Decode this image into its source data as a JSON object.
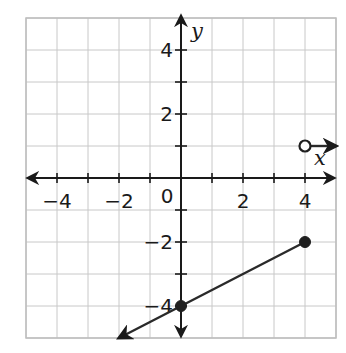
{
  "chart_data": {
    "type": "line",
    "title": "",
    "xlabel": "x",
    "ylabel": "y",
    "xlim": [
      -5,
      5
    ],
    "ylim": [
      -5,
      5
    ],
    "grid": true,
    "grid_step": 1,
    "x_ticks": [
      -4,
      -2,
      0,
      2,
      4
    ],
    "x_tick_labels": [
      "−4",
      "−2",
      "0",
      "2",
      "4"
    ],
    "y_ticks": [
      4,
      2,
      -2,
      -4
    ],
    "y_tick_labels": [
      "4",
      "2",
      "−2",
      "−4"
    ],
    "origin_label": "0",
    "series": [
      {
        "name": "segment-left",
        "description": "Line y = 0.5x - 4 for x <= 4, arrow pointing down-left",
        "points": [
          [
            -2,
            -5
          ],
          [
            0,
            -4
          ],
          [
            4,
            -2
          ]
        ],
        "arrow_start": true,
        "arrow_end": false,
        "markers": [
          {
            "x": 0,
            "y": -4,
            "type": "closed"
          },
          {
            "x": 4,
            "y": -2,
            "type": "closed"
          }
        ]
      },
      {
        "name": "ray-right",
        "description": "Horizontal ray y = 1 for x > 4, arrow pointing right",
        "points": [
          [
            4,
            1
          ],
          [
            5,
            1
          ]
        ],
        "arrow_start": false,
        "arrow_end": true,
        "markers": [
          {
            "x": 4,
            "y": 1,
            "type": "open"
          }
        ]
      }
    ],
    "colors": {
      "grid": "#c8c8c8",
      "axis": "#1a1a1a",
      "line": "#2a2a2a",
      "background": "#ffffff"
    }
  }
}
